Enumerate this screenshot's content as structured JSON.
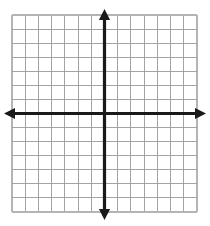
{
  "figure": {
    "name": "blank-coordinate-grid",
    "title": ""
  },
  "chart_data": {
    "type": "scatter",
    "title": "",
    "subtitle": "",
    "xlabel": "",
    "ylabel": "",
    "x": [],
    "y": [],
    "series": [],
    "categories": [],
    "values": [],
    "tick_labels_x": [],
    "tick_labels_y": [],
    "legend": [],
    "legend_position": "none",
    "annotations": [],
    "grid": true,
    "grid_columns": 14,
    "grid_rows": 14,
    "xlim": [
      -7,
      7
    ],
    "ylim": [
      -7,
      7
    ],
    "x_tick_step": 1,
    "y_tick_step": 1,
    "origin_x_index": 7,
    "origin_y_index": 7,
    "axes_visible": true,
    "x_axis_arrows": [
      "left",
      "right"
    ],
    "y_axis_arrows": [
      "up",
      "down"
    ]
  },
  "geometry": {
    "canvas_width": 210,
    "canvas_height": 226,
    "grid_left": 12,
    "grid_top": 15,
    "grid_right": 197,
    "grid_bottom": 212,
    "cell_width": 13.21,
    "cell_height": 14.07,
    "origin_px_x": 104.5,
    "origin_px_y": 113.5,
    "x_arrow_left_tip": 4,
    "x_arrow_right_tip": 206,
    "y_arrow_top_tip": 9,
    "y_arrow_bottom_tip": 220,
    "axis_stroke_width": 3.2,
    "grid_stroke_width": 0.9,
    "grid_border_stroke_width": 1.6
  },
  "colors": {
    "background": "#ffffff",
    "grid_line": "#9a9a9a",
    "grid_border": "#b4b4b4",
    "axis": "#1a1a1a"
  }
}
